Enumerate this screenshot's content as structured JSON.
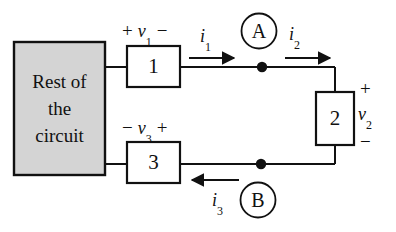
{
  "diagram": {
    "background_color": "#ffffff",
    "line_color": "#111111",
    "block_fill_color": "#d4d4d4",
    "source_block": {
      "label_lines": [
        "Rest of",
        "the",
        "circuit"
      ]
    },
    "elements": [
      {
        "name": "element-1",
        "label": "1"
      },
      {
        "name": "element-2",
        "label": "2"
      },
      {
        "name": "element-3",
        "label": "3"
      }
    ],
    "voltages": {
      "v1": {
        "left_sign": "+",
        "symbol": "v",
        "subscript": "1",
        "right_sign": "−"
      },
      "v3": {
        "left_sign": "−",
        "symbol": "v",
        "subscript": "3",
        "right_sign": "+"
      },
      "v2": {
        "top_sign": "+",
        "symbol": "v",
        "subscript": "2",
        "bottom_sign": "−"
      }
    },
    "currents": {
      "i1": {
        "symbol": "i",
        "subscript": "1",
        "direction": "right"
      },
      "i2": {
        "symbol": "i",
        "subscript": "2",
        "direction": "right"
      },
      "i3": {
        "symbol": "i",
        "subscript": "3",
        "direction": "left"
      }
    },
    "meters": [
      {
        "name": "meter-a",
        "label": "A"
      },
      {
        "name": "meter-b",
        "label": "B"
      }
    ]
  }
}
